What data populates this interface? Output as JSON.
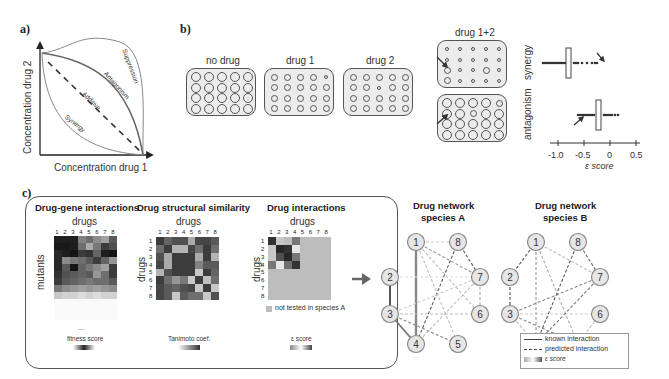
{
  "panel_a": {
    "label": "a)",
    "x_axis": "Concentration drug 1",
    "y_axis": "Concentration drug 2",
    "curves": [
      "Suppression",
      "Antagonism",
      "Additive",
      "Synergy"
    ]
  },
  "panel_b": {
    "label": "b)",
    "plates": [
      {
        "title": "no drug"
      },
      {
        "title": "drug 1"
      },
      {
        "title": "drug 2"
      },
      {
        "title": "drug 1+2"
      }
    ],
    "row_labels": [
      "synergy",
      "antagonism"
    ],
    "axis": {
      "label": "ε score",
      "ticks": [
        "-1.0",
        "-0.5",
        "0",
        "0.5"
      ]
    }
  },
  "panel_c": {
    "label": "c)",
    "sections": [
      {
        "title": "Drug-gene interactions",
        "x_label": "drugs",
        "y_label": "mutants",
        "ellipsis": "...",
        "legend": "fitness score"
      },
      {
        "title": "Drug structural similarity",
        "x_label": "drugs",
        "y_label": "drugs",
        "legend": "Tanimoto coef."
      },
      {
        "title": "Drug interactions",
        "x_label": "drugs",
        "y_label": "drugs",
        "note": "not tested in species A",
        "legend": "ε score"
      }
    ],
    "col_numbers": [
      "1",
      "2",
      "3",
      "4",
      "5",
      "6",
      "7",
      "8"
    ],
    "networks": [
      {
        "title_line1": "Drug network",
        "title_line2": "species A"
      },
      {
        "title_line1": "Drug network",
        "title_line2": "species B"
      }
    ],
    "node_labels": [
      "1",
      "2",
      "3",
      "4",
      "5",
      "6",
      "7",
      "8"
    ],
    "legend": {
      "known": "known interaction",
      "predicted": "predicted interaction",
      "score": "ε score"
    }
  },
  "colors": {
    "line": "#555555",
    "plate_fill": "#ececec",
    "not_tested": "#bdbdbd",
    "arrow": "#666666"
  }
}
